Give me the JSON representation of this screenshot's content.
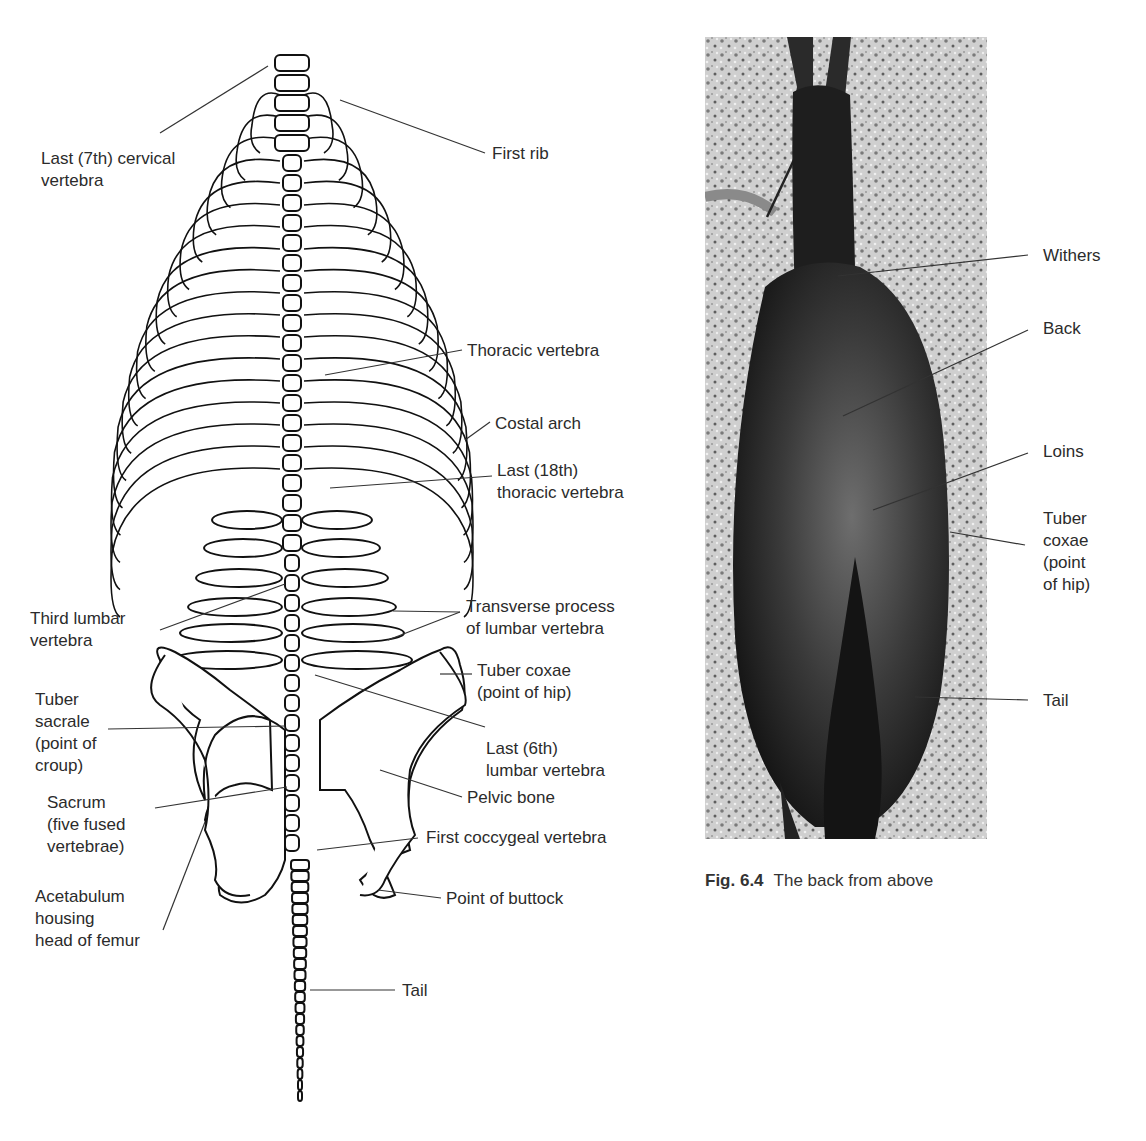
{
  "figure": {
    "number": "Fig. 6.4",
    "caption": "The back from above"
  },
  "skeleton": {
    "labels": {
      "last_cervical": "Last (7th) cervical\nvertebra",
      "first_rib": "First rib",
      "thoracic_vertebra": "Thoracic vertebra",
      "costal_arch": "Costal arch",
      "last_thoracic": "Last (18th)\nthoracic vertebra",
      "third_lumbar": "Third lumbar\nvertebra",
      "transverse_process": "Transverse process\nof lumbar vertebra",
      "tuber_coxae": "Tuber coxae\n(point of hip)",
      "tuber_sacrale": "Tuber\nsacrale\n(point of\ncroup)",
      "last_lumbar": "Last (6th)\nlumbar vertebra",
      "pelvic_bone": "Pelvic bone",
      "sacrum": "Sacrum\n(five fused\nvertebrae)",
      "first_coccygeal": "First coccygeal vertebra",
      "acetabulum": "Acetabulum\nhousing\nhead of femur",
      "point_of_buttock": "Point of buttock",
      "tail": "Tail"
    }
  },
  "photo": {
    "labels": {
      "withers": "Withers",
      "back": "Back",
      "loins": "Loins",
      "tuber_coxae": "Tuber\ncoxae\n(point\nof hip)",
      "tail": "Tail"
    }
  }
}
